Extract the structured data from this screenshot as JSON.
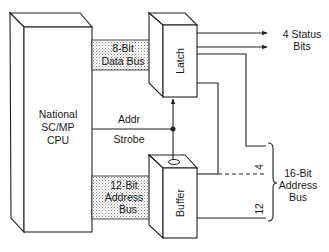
{
  "diagram": {
    "type": "block-diagram",
    "title": "",
    "colors": {
      "line": "#222222",
      "bus_fill": "#d9d9d9",
      "background": "#ffffff"
    },
    "blocks": {
      "cpu": {
        "lines": [
          "National",
          "SC/MP",
          "CPU"
        ]
      },
      "latch": {
        "label": "Latch"
      },
      "buffer": {
        "label": "Buffer"
      }
    },
    "buses": {
      "data_bus": {
        "lines": [
          "8-Bit",
          "Data Bus"
        ]
      },
      "address_bus": {
        "lines": [
          "12-Bit",
          "Address",
          "Bus"
        ]
      }
    },
    "signals": {
      "addr_strobe": {
        "line1": "Addr",
        "line2": "Strobe"
      }
    },
    "outputs": {
      "status_bits": {
        "lines": [
          "4 Status",
          "Bits"
        ]
      },
      "address_bus_16": {
        "lines": [
          "16-Bit",
          "Address",
          "Bus"
        ]
      },
      "count_upper": "4",
      "count_lower": "12"
    }
  }
}
